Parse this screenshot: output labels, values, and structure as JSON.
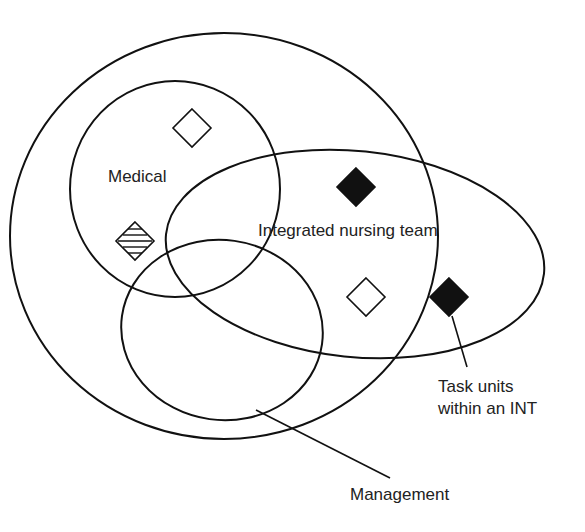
{
  "diagram": {
    "type": "venn",
    "labels": {
      "medical": "Medical",
      "integrated_nursing_team": "Integrated nursing team",
      "task_units_line1": "Task units",
      "task_units_line2": "within an INT",
      "management": "Management"
    },
    "sets": [
      "Outer organisation",
      "Medical",
      "Integrated nursing team",
      "Management"
    ],
    "markers": [
      {
        "style": "open",
        "location": "Medical only"
      },
      {
        "style": "hatched",
        "location": "Medical only"
      },
      {
        "style": "filled",
        "location": "Integrated nursing team within outer"
      },
      {
        "style": "open",
        "location": "Integrated nursing team within outer"
      },
      {
        "style": "filled",
        "location": "Integrated nursing team outside outer",
        "annotated_by": "Task units within an INT"
      }
    ],
    "colors": {
      "stroke": "#111111",
      "text": "#222222",
      "background": "#ffffff"
    }
  }
}
